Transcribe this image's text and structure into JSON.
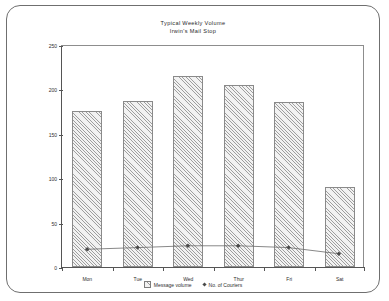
{
  "chart_data": {
    "type": "bar",
    "title": "Typical Weekly Volume",
    "subtitle": "Irwin's Mail Stop",
    "xlabel": "",
    "ylabel": "",
    "ylim": [
      0,
      250
    ],
    "yticks": [
      0,
      50,
      100,
      150,
      200,
      250
    ],
    "grid": false,
    "legend_position": "bottom",
    "categories": [
      "Mon",
      "Tue",
      "Wed",
      "Thur",
      "Fri",
      "Sat"
    ],
    "series": [
      {
        "name": "Message volume",
        "type": "bar",
        "values": [
          176,
          187,
          215,
          205,
          186,
          90
        ]
      },
      {
        "name": "No. of Couriers",
        "type": "line",
        "values": [
          20,
          22,
          24,
          24,
          22,
          15
        ]
      }
    ]
  },
  "legend": {
    "items": [
      {
        "label": "Message volume",
        "marker": "hatched-square-swatch"
      },
      {
        "label": "No. of Couriers",
        "marker": "diamond-point-marker"
      }
    ]
  },
  "colors": {
    "frame": "#6f6f6f",
    "axis": "#555555",
    "bar_fill": "#f2f2f2",
    "bar_edge": "#8a8a8a",
    "line": "#6a6a6a",
    "marker": "#4a4a4a",
    "text": "#2e2e2e"
  }
}
